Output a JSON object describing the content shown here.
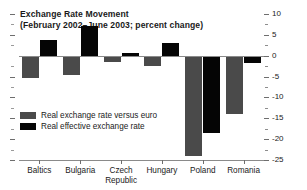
{
  "chart_data": {
    "type": "bar",
    "title": "Exchange Rate Movement",
    "subtitle": "(February 2002–June 2003; percent change)",
    "xlabel": "",
    "ylabel": "",
    "ylim": [
      -25,
      10
    ],
    "ytick_step": 5,
    "ytick_minor_step": 2.5,
    "grid": false,
    "legend_position": "inside-bottom-left",
    "categories": [
      "Baltics",
      "Bulgaria",
      "Czech Republic",
      "Hungary",
      "Poland",
      "Romania"
    ],
    "series": [
      {
        "name": "Real exchange rate versus euro",
        "color": "#4a4a4a",
        "values": [
          -5.4,
          -4.6,
          -1.6,
          -2.6,
          -24.0,
          -14.0
        ]
      },
      {
        "name": "Real effective exchange rate",
        "color": "#050505",
        "values": [
          3.7,
          7.2,
          0.6,
          3.1,
          -18.5,
          -1.7
        ]
      }
    ],
    "ytick_labels": [
      "10",
      "5",
      "0",
      "-5",
      "-10",
      "-15",
      "-20",
      "-25"
    ],
    "ytick_values": [
      10,
      5,
      0,
      -5,
      -10,
      -15,
      -20,
      -25
    ]
  },
  "legend": {
    "items": [
      {
        "label": "Real exchange rate versus euro",
        "swatch": "euro"
      },
      {
        "label": "Real effective exchange rate",
        "swatch": "effect"
      }
    ]
  }
}
